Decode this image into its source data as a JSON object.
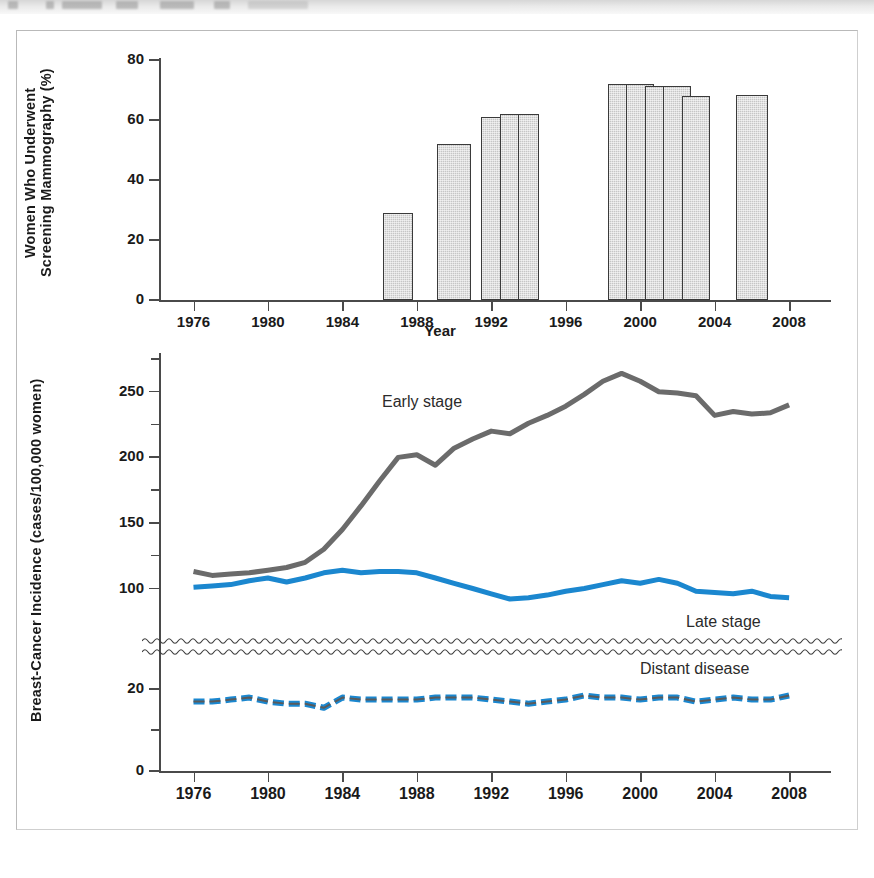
{
  "figure": {
    "header_fragment": "scanned page header",
    "panels": [
      "mammography-bar-panel",
      "incidence-line-panel"
    ]
  },
  "chart_data": [
    {
      "id": "mammography",
      "type": "bar",
      "title": "",
      "xlabel": "Year",
      "ylabel": "Women Who Underwent Screening Mammography (%)",
      "ylim": [
        0,
        80
      ],
      "yticks": [
        0,
        20,
        40,
        60,
        80
      ],
      "ytick_labels": [
        "0",
        "20",
        "40",
        "60",
        "80"
      ],
      "xlim": [
        1974,
        2010
      ],
      "xticks": [
        1976,
        1980,
        1984,
        1988,
        1992,
        1996,
        2000,
        2004,
        2008
      ],
      "xtick_labels": [
        "1976",
        "1980",
        "1984",
        "1988",
        "1992",
        "1996",
        "2000",
        "2004",
        "2008"
      ],
      "grid": false,
      "legend": "none",
      "bar_color": "#c6c6c6",
      "bar_edge_color": "#3a3a3a",
      "categories": [
        1987,
        1990,
        1992,
        1993,
        1994,
        1999,
        2000,
        2001,
        2002,
        2003,
        2005,
        2006,
        2008
      ],
      "values": [
        29,
        52,
        61,
        62,
        62,
        72,
        72,
        72,
        71.5,
        71.5,
        68,
        68,
        68.5
      ],
      "bars": [
        {
          "year": 1987,
          "value": 29,
          "width_years": 1.6
        },
        {
          "year": 1990,
          "value": 52,
          "width_years": 1.8
        },
        {
          "year": 1992,
          "value": 61,
          "width_years": 1.1
        },
        {
          "year": 1993,
          "value": 62,
          "width_years": 1.1
        },
        {
          "year": 1994,
          "value": 62,
          "width_years": 1.1
        },
        {
          "year": 1999,
          "value": 72,
          "width_years": 1.5
        },
        {
          "year": 2000,
          "value": 72,
          "width_years": 1.5
        },
        {
          "year": 2001,
          "value": 71.5,
          "width_years": 1.5
        },
        {
          "year": 2002,
          "value": 71.5,
          "width_years": 1.5
        },
        {
          "year": 2003,
          "value": 68,
          "width_years": 1.5
        },
        {
          "year": 2006,
          "value": 68.5,
          "width_years": 1.7
        }
      ]
    },
    {
      "id": "incidence",
      "type": "line",
      "title": "",
      "xlabel": "",
      "ylabel": "Breast-Cancer Incidence (cases/100,000 women)",
      "ylim": [
        0,
        275
      ],
      "yticks": [
        0,
        20,
        100,
        150,
        200,
        250
      ],
      "ytick_labels": [
        "0",
        "20",
        "100",
        "150",
        "200",
        "250"
      ],
      "minor_yticks": [
        10,
        125,
        175,
        225,
        275
      ],
      "axis_break": {
        "between": [
          25,
          60
        ],
        "style": "wavy"
      },
      "xlim": [
        1974,
        2010
      ],
      "xticks": [
        1976,
        1980,
        1984,
        1988,
        1992,
        1996,
        2000,
        2004,
        2008
      ],
      "xtick_labels": [
        "1976",
        "1980",
        "1984",
        "1988",
        "1992",
        "1996",
        "2000",
        "2004",
        "2008"
      ],
      "grid": false,
      "legend": "inline-annotations",
      "annotations": [
        {
          "text": "Early stage",
          "x": 1988,
          "y": 238
        },
        {
          "text": "Late stage",
          "x": 2003,
          "y": 110
        },
        {
          "text": "Distant disease",
          "x": 2002,
          "y": 22
        }
      ],
      "x": [
        1976,
        1977,
        1978,
        1979,
        1980,
        1981,
        1982,
        1983,
        1984,
        1985,
        1986,
        1987,
        1988,
        1989,
        1990,
        1991,
        1992,
        1993,
        1994,
        1995,
        1996,
        1997,
        1998,
        1999,
        2000,
        2001,
        2002,
        2003,
        2004,
        2005,
        2006,
        2007,
        2008
      ],
      "series": [
        {
          "name": "Early stage",
          "color": "#6b6b6b",
          "style": "solid",
          "values": [
            113,
            110,
            111,
            112,
            114,
            116,
            120,
            130,
            145,
            163,
            182,
            200,
            202,
            194,
            207,
            214,
            220,
            218,
            226,
            232,
            239,
            248,
            258,
            264,
            258,
            250,
            249,
            247,
            232,
            235,
            233,
            234,
            240
          ]
        },
        {
          "name": "Late stage",
          "color": "#1b87cf",
          "style": "solid",
          "values": [
            101,
            102,
            103,
            106,
            108,
            105,
            108,
            112,
            114,
            112,
            113,
            113,
            112,
            108,
            104,
            100,
            96,
            92,
            93,
            95,
            98,
            100,
            103,
            106,
            104,
            107,
            104,
            98,
            97,
            96,
            98,
            94,
            93
          ]
        },
        {
          "name": "Distant disease",
          "color": "#1b87cf",
          "style": "dashed",
          "values": [
            17,
            17,
            17.5,
            18,
            17,
            16.5,
            16.5,
            15.5,
            18,
            17.5,
            17.5,
            17.5,
            17.5,
            18,
            18,
            18,
            17.5,
            17,
            16.5,
            17,
            17.5,
            18.5,
            18,
            18,
            17.5,
            18,
            18,
            17,
            17.5,
            18,
            17.5,
            17.5,
            18.5
          ]
        }
      ]
    }
  ]
}
